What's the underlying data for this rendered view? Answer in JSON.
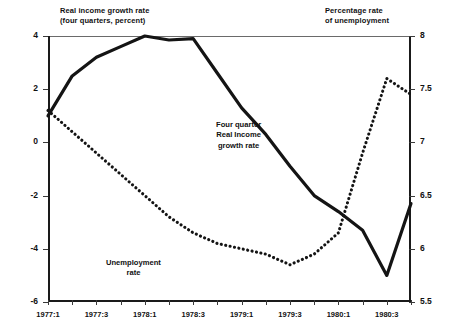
{
  "header": {
    "left_label": "Real income growth rate\n(four quarters, percent)",
    "right_label": "Percentage rate\nof unemployment"
  },
  "annotations": {
    "income": "Four quarter\nReal Income\ngrowth rate",
    "unemployment": "Unemployment\nrate"
  },
  "chart_data": {
    "type": "line",
    "title": "",
    "xlabel": "",
    "grid": false,
    "legend": "inline-annotations",
    "x": [
      "1977:1",
      "1977:2",
      "1977:3",
      "1977:4",
      "1978:1",
      "1978:2",
      "1978:3",
      "1978:4",
      "1979:1",
      "1979:2",
      "1979:3",
      "1979:4",
      "1980:1",
      "1980:2",
      "1980:3",
      "1980:4"
    ],
    "xticklabels": [
      "1977:1",
      "1977:3",
      "1978:1",
      "1978:3",
      "1979:1",
      "1979:3",
      "1980:1",
      "1980:3"
    ],
    "left_axis": {
      "label": "Real income growth rate (four quarters, percent)",
      "ticks": [
        4,
        2,
        0,
        -2,
        -4,
        -6
      ],
      "ticklabels": [
        "4",
        "2",
        "0",
        "-2",
        "-4",
        "-6"
      ],
      "ylim": [
        -6,
        4
      ]
    },
    "right_axis": {
      "label": "Percentage rate of unemployment",
      "ticks": [
        8,
        7.5,
        7,
        6.5,
        6,
        5.5
      ],
      "ticklabels": [
        "8",
        "7.5",
        "7",
        "6.5",
        "6",
        "5.5"
      ],
      "ylim": [
        5.5,
        8
      ]
    },
    "series": [
      {
        "name": "Four quarter Real Income growth rate",
        "style": "solid",
        "axis": "left",
        "values": [
          1.0,
          2.5,
          3.2,
          3.6,
          4.0,
          3.85,
          3.9,
          2.6,
          1.3,
          0.3,
          -0.9,
          -2.0,
          -2.6,
          -3.3,
          -5.0,
          -2.3
        ]
      },
      {
        "name": "Unemployment rate",
        "style": "dotted",
        "axis": "right",
        "values": [
          7.3,
          7.1,
          6.9,
          6.7,
          6.5,
          6.3,
          6.15,
          6.05,
          6.0,
          5.95,
          5.85,
          5.95,
          6.15,
          6.9,
          7.6,
          7.45
        ]
      }
    ]
  }
}
